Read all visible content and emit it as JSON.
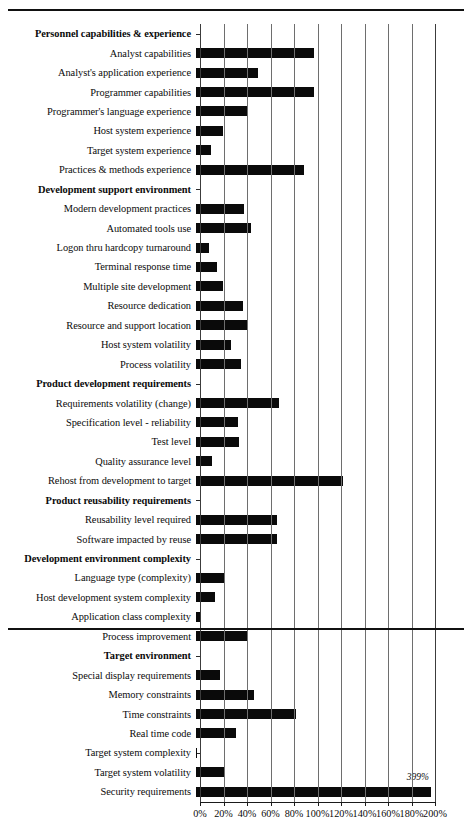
{
  "chart_data": {
    "type": "bar",
    "orientation": "horizontal",
    "title": "",
    "xlabel": "",
    "ylabel": "",
    "xlim": [
      0,
      200
    ],
    "xtick_labels": [
      "0%",
      "20%",
      "40%",
      "60%",
      "80%",
      "100%",
      "120%",
      "140%",
      "160%",
      "180%",
      "200%"
    ],
    "xtick_values": [
      0,
      20,
      40,
      60,
      80,
      100,
      120,
      140,
      160,
      180,
      200
    ],
    "grid": true,
    "legend": "none",
    "bar_color": "#0a0a0a",
    "categories": [
      "Personnel capabilities & experience",
      "Analyst capabilities",
      "Analyst's application experience",
      "Programmer capabilities",
      "Programmer's language experience",
      "Host system experience",
      "Target system experience",
      "Practices & methods experience",
      "Development support environment",
      "Modern development practices",
      "Automated tools use",
      "Logon thru hardcopy turnaround",
      "Terminal response time",
      "Multiple site development",
      "Resource dedication",
      "Resource and support location",
      "Host system volatility",
      "Process volatility",
      "Product development requirements",
      "Requirements volatility (change)",
      "Specification level - reliability",
      "Test level",
      "Quality assurance level",
      "Rehost from development to target",
      "Product reusability requirements",
      "Reusability level required",
      "Software impacted by reuse",
      "Development environment complexity",
      "Language type (complexity)",
      "Host development system complexity",
      "Application class complexity",
      "Process improvement",
      "Target environment",
      "Special display requirements",
      "Memory constraints",
      "Time constraints",
      "Real time code",
      "Target system complexity",
      "Target system volatility",
      "Security requirements"
    ],
    "values": [
      null,
      100,
      53,
      100,
      44,
      23,
      13,
      92,
      null,
      41,
      47,
      11,
      18,
      23,
      40,
      43,
      30,
      38,
      null,
      71,
      36,
      37,
      14,
      125,
      null,
      69,
      69,
      null,
      24,
      16,
      3,
      44,
      null,
      20,
      49,
      85,
      34,
      1,
      24,
      399
    ],
    "is_header": [
      true,
      false,
      false,
      false,
      false,
      false,
      false,
      false,
      true,
      false,
      false,
      false,
      false,
      false,
      false,
      false,
      false,
      false,
      true,
      false,
      false,
      false,
      false,
      false,
      true,
      false,
      false,
      true,
      false,
      false,
      false,
      false,
      true,
      false,
      false,
      false,
      false,
      false,
      false,
      false
    ],
    "annotations": [
      {
        "category": "Security requirements",
        "text": "399%",
        "note": "bar clipped at axis maximum of 200%"
      }
    ]
  }
}
